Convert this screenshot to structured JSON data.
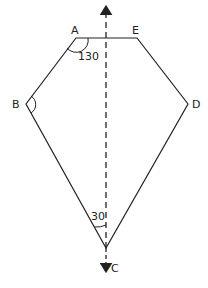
{
  "diagram": {
    "vertices": {
      "A": {
        "label": "A",
        "x": 76,
        "y": 38
      },
      "E": {
        "label": "E",
        "x": 137,
        "y": 38
      },
      "B": {
        "label": "B",
        "x": 26,
        "y": 104
      },
      "D": {
        "label": "D",
        "x": 188,
        "y": 104
      },
      "C": {
        "label": "C",
        "x": 106,
        "y": 248
      }
    },
    "angles": {
      "A": {
        "value": "130"
      },
      "C": {
        "value": "30"
      }
    },
    "axis": {
      "type": "dashed-vertical-arrow",
      "x": 106
    },
    "colors": {
      "stroke": "#222222",
      "background": "#ffffff"
    }
  }
}
